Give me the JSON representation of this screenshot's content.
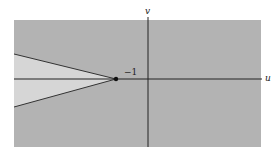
{
  "figure": {
    "axes": {
      "horizontal_label": "u",
      "vertical_label": "v"
    },
    "point": {
      "label": "−1",
      "u": -1,
      "v": 0
    },
    "regions": {
      "shaded_region_color": "#b3b3b3",
      "wedge_region_color": "#d6d6d6"
    }
  }
}
